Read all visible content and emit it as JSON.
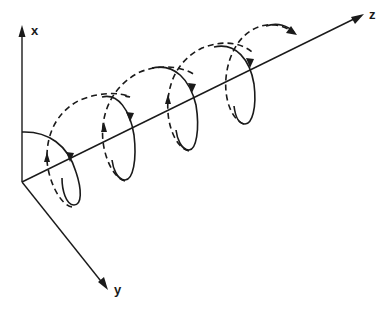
{
  "diagram": {
    "type": "3d-helix-axes",
    "axes": {
      "x": {
        "label": "x"
      },
      "y": {
        "label": "y"
      },
      "z": {
        "label": "z"
      }
    },
    "helix": {
      "turns": 4,
      "front_segments": "solid",
      "back_segments": "dashed",
      "direction_arrows": true
    },
    "colors": {
      "stroke": "#1a1a1a",
      "background": "#ffffff"
    }
  }
}
